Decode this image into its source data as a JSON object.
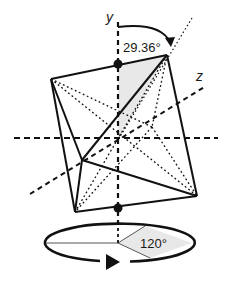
{
  "diagram": {
    "axes": {
      "y_label": "y",
      "z_label": "z"
    },
    "angles": {
      "tilt_label": "29.36°",
      "rotation_label": "120°"
    },
    "colors": {
      "stroke": "#111111",
      "shade": "#e6e6e6",
      "background": "#ffffff"
    }
  }
}
